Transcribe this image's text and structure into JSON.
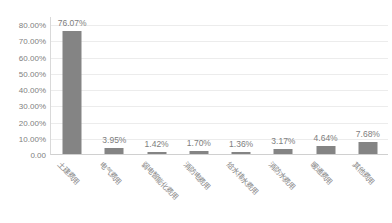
{
  "chart_data": {
    "type": "bar",
    "title": "",
    "subtitle": "",
    "xlabel": "",
    "ylabel": "",
    "categories": [
      "土建费用",
      "电气费用",
      "弱电智能化费用",
      "消防电费用",
      "给水排水费用",
      "消防水费用",
      "暖通费用",
      "其他费用"
    ],
    "values": [
      76.07,
      3.95,
      1.42,
      1.7,
      1.36,
      3.17,
      4.64,
      7.68
    ],
    "data_labels": [
      "76.07%",
      "3.95%",
      "1.42%",
      "1.70%",
      "1.36%",
      "3.17%",
      "4.64%",
      "7.68%"
    ],
    "ylim": [
      0,
      85
    ],
    "yticks": [
      0,
      10,
      20,
      30,
      40,
      50,
      60,
      70,
      80
    ],
    "ytick_labels": [
      "0.00",
      "10.00%",
      "20.00%",
      "30.00%",
      "40.00%",
      "50.00%",
      "60.00%",
      "70.00%",
      "80.00%"
    ],
    "grid": true,
    "legend": false,
    "legend_position": "none",
    "series": [
      {
        "name": "",
        "values": [
          76.07,
          3.95,
          1.42,
          1.7,
          1.36,
          3.17,
          4.64,
          7.68
        ]
      }
    ],
    "colors": {
      "bar": "#848484",
      "gridline": "#ececec",
      "axis": "#d0d0d0",
      "tick_text": "#808080",
      "label_text": "#7d7d7d",
      "background": "#ffffff"
    }
  }
}
